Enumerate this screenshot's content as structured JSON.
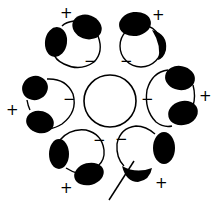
{
  "diagram": {
    "colors": {
      "stroke": "#000000",
      "fill": "#000000",
      "background": "#ffffff"
    },
    "center_circle": {
      "cx": 110,
      "cy": 101,
      "r": 26
    },
    "units": [
      {
        "id": "top-left",
        "plus": "+",
        "minus": "−"
      },
      {
        "id": "top-right",
        "plus": "+",
        "minus": "−"
      },
      {
        "id": "right",
        "plus": "+",
        "minus": "−"
      },
      {
        "id": "bottom-right",
        "plus": "+",
        "minus": "−"
      },
      {
        "id": "bottom-left",
        "plus": "+",
        "minus": "−"
      },
      {
        "id": "left",
        "plus": "+",
        "minus": "−"
      }
    ]
  }
}
